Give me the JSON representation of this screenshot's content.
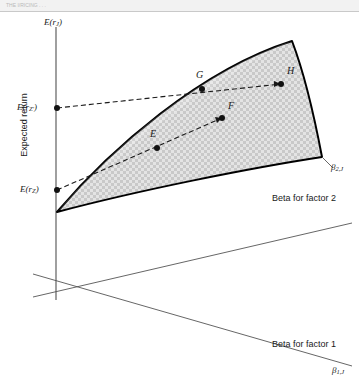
{
  "figure": {
    "top_strip_ghost_text": "THE I/RICING     .   .    .",
    "y_axis_label": "E(r",
    "y_axis_label_sub": "J",
    "y_axis_label_close": ")",
    "expected_return_label": "Expected return",
    "intercept_high_label": "E(r",
    "intercept_high_sub": "Z'",
    "intercept_high_close": ")",
    "intercept_low_label": "E(r",
    "intercept_low_sub": "Z",
    "intercept_low_close": ")",
    "beta2_axis_label": "Beta for factor 2",
    "beta2_tick_label": "β",
    "beta2_tick_sub": "2,J",
    "beta1_axis_label": "Beta for factor 1",
    "beta1_tick_label": "β",
    "beta1_tick_sub": "1,J",
    "points": [
      {
        "id": "E",
        "label": "E",
        "x": 157,
        "y": 148,
        "label_x": 150,
        "label_y": 134
      },
      {
        "id": "F",
        "label": "F",
        "x": 222,
        "y": 118,
        "label_x": 228,
        "label_y": 106
      },
      {
        "id": "G",
        "label": "G",
        "x": 202,
        "y": 89,
        "label_x": 196,
        "label_y": 75
      },
      {
        "id": "H",
        "label": "H",
        "x": 281,
        "y": 84,
        "label_x": 287,
        "label_y": 71
      }
    ],
    "colors": {
      "plane_fill": "#d6d6d6",
      "plane_stroke": "#000000",
      "axis_stroke": "#555555",
      "dashed_stroke": "#1a1a1a",
      "text": "#1a1a1a"
    }
  }
}
